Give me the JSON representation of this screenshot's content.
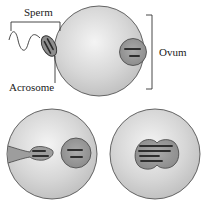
{
  "labels": {
    "sperm": "Sperm",
    "acrosome": "Acrosome",
    "ovum": "Ovum"
  },
  "panels": [
    {
      "id": "approach",
      "description": "Sperm with acrosome contacting ovum membrane; ovum nucleus visible"
    },
    {
      "id": "penetration",
      "description": "Sperm head inside ovum beside ovum pronucleus"
    },
    {
      "id": "fusion",
      "description": "Male and female pronuclei fused"
    }
  ],
  "colors": {
    "cell_fill": "#d4d4d4",
    "cell_highlight": "#f2f2f2",
    "cell_outline": "#555555",
    "nucleus_fill": "#9a9a9a",
    "chromosome": "#3a3a3a",
    "line": "#333333"
  }
}
